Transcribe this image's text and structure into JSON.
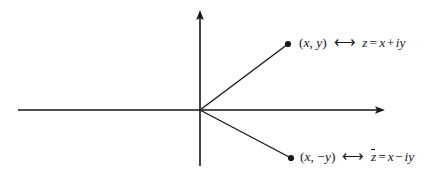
{
  "figure": {
    "kind": "complex-plane-diagram",
    "background": "#ffffff",
    "ink": "#17171c",
    "width": 437,
    "height": 178
  },
  "axes": {
    "origin": {
      "x": 200,
      "y": 110
    },
    "horizontal": {
      "name": "real-axis",
      "x_start": 18,
      "x_end": 385,
      "y": 110,
      "arrow_at": "end"
    },
    "vertical": {
      "name": "imaginary-axis",
      "y_start": 10,
      "y_end": 166,
      "x": 200,
      "arrow_at": "start"
    }
  },
  "points": [
    {
      "name": "point-z",
      "x": 288,
      "y": 44,
      "dot_radius": 3.1,
      "label_id": "label-upper"
    },
    {
      "name": "point-z-conjugate",
      "x": 291,
      "y": 158,
      "dot_radius": 3.1,
      "label_id": "label-lower"
    }
  ],
  "labels": {
    "upper": {
      "coordinate_open": "(",
      "coordinate_x": "x",
      "coordinate_comma": ", ",
      "coordinate_y": "y",
      "coordinate_close": ")",
      "correspondence": "⟷",
      "symbol": "z",
      "equals": "=",
      "term_real": "x",
      "operator": "+",
      "imaginary_unit": "i",
      "term_imag": "y",
      "full_text": "(x, y)  ⟷  z = x + iy"
    },
    "lower": {
      "coordinate_open": "(",
      "coordinate_x": "x",
      "coordinate_comma": ", ",
      "coordinate_sign": "−",
      "coordinate_y": "y",
      "coordinate_close": ")",
      "correspondence": "⟷",
      "symbol": "z",
      "equals": "=",
      "term_real": "x",
      "operator": "−",
      "imaginary_unit": "i",
      "term_imag": "y",
      "full_text": "(x, −y)  ⟷  z̄ = x − iy"
    }
  }
}
